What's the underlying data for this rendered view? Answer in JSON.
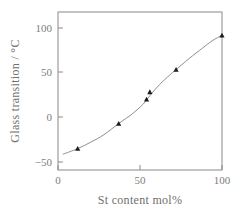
{
  "chart_data": {
    "type": "scatter",
    "title": "",
    "subtitle": "",
    "xlabel": "St content mol%",
    "ylabel": "Glass transition / °C",
    "xlim": [
      0,
      100
    ],
    "ylim": [
      -50,
      120
    ],
    "xticks": [
      0,
      50,
      100
    ],
    "xticklabels": [
      "0",
      "50",
      "100"
    ],
    "yticks": [
      -50,
      0,
      50,
      100
    ],
    "yticklabels": [
      "−50",
      "0",
      "50",
      "100"
    ],
    "grid": false,
    "legend": null,
    "marker_style": "filled-triangle",
    "series": [
      {
        "name": "Glass transition temperature",
        "x": [
          12,
          37,
          54,
          56,
          72,
          100
        ],
        "y": [
          -27,
          0,
          26,
          34,
          58,
          95
        ]
      }
    ],
    "fit_curve": {
      "name": "smoothed trend line",
      "x": [
        3,
        12,
        20,
        28,
        37,
        45,
        52,
        56,
        62,
        68,
        72,
        80,
        88,
        94,
        100
      ],
      "y": [
        -33,
        -27,
        -20,
        -12,
        0,
        10,
        21,
        30,
        42,
        52,
        58,
        70,
        81,
        89,
        95
      ]
    },
    "axis_ticks_direction": "inward",
    "frame": "full-box",
    "colors": {
      "axis": "#8a8a8a",
      "curve": "#8d8d8d",
      "marker": "#1a1a1a",
      "text": "#7d7d7d",
      "background": "#ffffff"
    }
  }
}
